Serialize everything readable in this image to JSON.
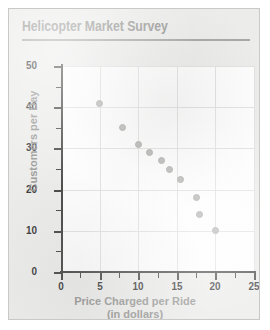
{
  "card": {
    "title": "Helicopter Market Survey"
  },
  "chart_data": {
    "type": "scatter",
    "title": "Helicopter Market Survey",
    "xlabel": "Price Charged per Ride",
    "xlabel_sub": "(in dollars)",
    "ylabel": "Customers per Day",
    "xlim": [
      0,
      25
    ],
    "ylim": [
      0,
      50
    ],
    "x_major_ticks": [
      0,
      5,
      10,
      15,
      20,
      25
    ],
    "y_major_ticks": [
      0,
      10,
      20,
      30,
      40,
      50
    ],
    "x_minor_interval": 2.5,
    "y_minor_interval": 5,
    "grid": true,
    "legend": "none",
    "marker_color": "#b9b9b7",
    "points": [
      {
        "x": 5,
        "y": 41
      },
      {
        "x": 8,
        "y": 35
      },
      {
        "x": 10,
        "y": 31
      },
      {
        "x": 11.5,
        "y": 29
      },
      {
        "x": 13,
        "y": 27
      },
      {
        "x": 14,
        "y": 25
      },
      {
        "x": 15.5,
        "y": 22.5
      },
      {
        "x": 17.5,
        "y": 18
      },
      {
        "x": 18,
        "y": 14
      },
      {
        "x": 20,
        "y": 10
      }
    ]
  }
}
